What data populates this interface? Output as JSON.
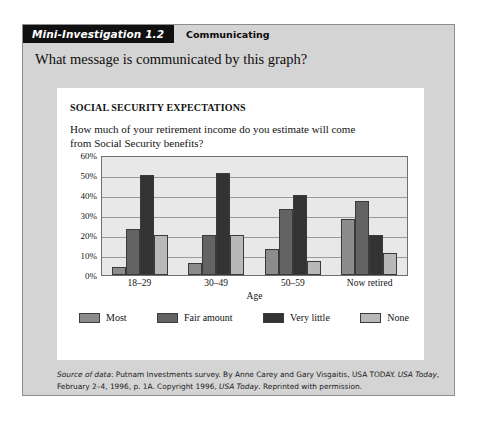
{
  "header": {
    "tab_label": "Mini-Investigation 1.2",
    "subject_label": "Communicating"
  },
  "prompt": "What message is communicated by this graph?",
  "figure": {
    "title": "SOCIAL SECURITY EXPECTATIONS",
    "question": "How much of your retirement income do you estimate will come from Social Security benefits?"
  },
  "source_note": {
    "lead_italic": "Source of data",
    "part1": ": Putnam Investments survey. By Anne Carey and Gary Visgaitis, USA TODAY. ",
    "italic1": "USA Today",
    "part2": ", February 2–4, 1996, p. 1A. Copyright 1996, ",
    "italic2": "USA Today",
    "part3": ". Reprinted with permission."
  },
  "chart_data": {
    "type": "bar",
    "title": "SOCIAL SECURITY EXPECTATIONS",
    "subtitle": "How much of your retirement income do you estimate will come from Social Security benefits?",
    "xlabel": "Age",
    "ylabel": "",
    "ylim": [
      0,
      60
    ],
    "ytick_labels": [
      "0%",
      "10%",
      "20%",
      "30%",
      "40%",
      "50%",
      "60%"
    ],
    "ytick_values": [
      0,
      10,
      20,
      30,
      40,
      50,
      60
    ],
    "grid": true,
    "legend_position": "bottom",
    "categories": [
      "18–29",
      "30–49",
      "50–59",
      "Now retired"
    ],
    "series": [
      {
        "name": "Most",
        "color": "#8c8c8c",
        "values": [
          4,
          6,
          13,
          28
        ]
      },
      {
        "name": "Fair amount",
        "color": "#636363",
        "values": [
          23,
          20,
          33,
          37
        ]
      },
      {
        "name": "Very little",
        "color": "#333333",
        "values": [
          50,
          51,
          40,
          20
        ]
      },
      {
        "name": "None",
        "color": "#b8b8b8",
        "values": [
          20,
          20,
          7,
          11
        ]
      }
    ]
  }
}
